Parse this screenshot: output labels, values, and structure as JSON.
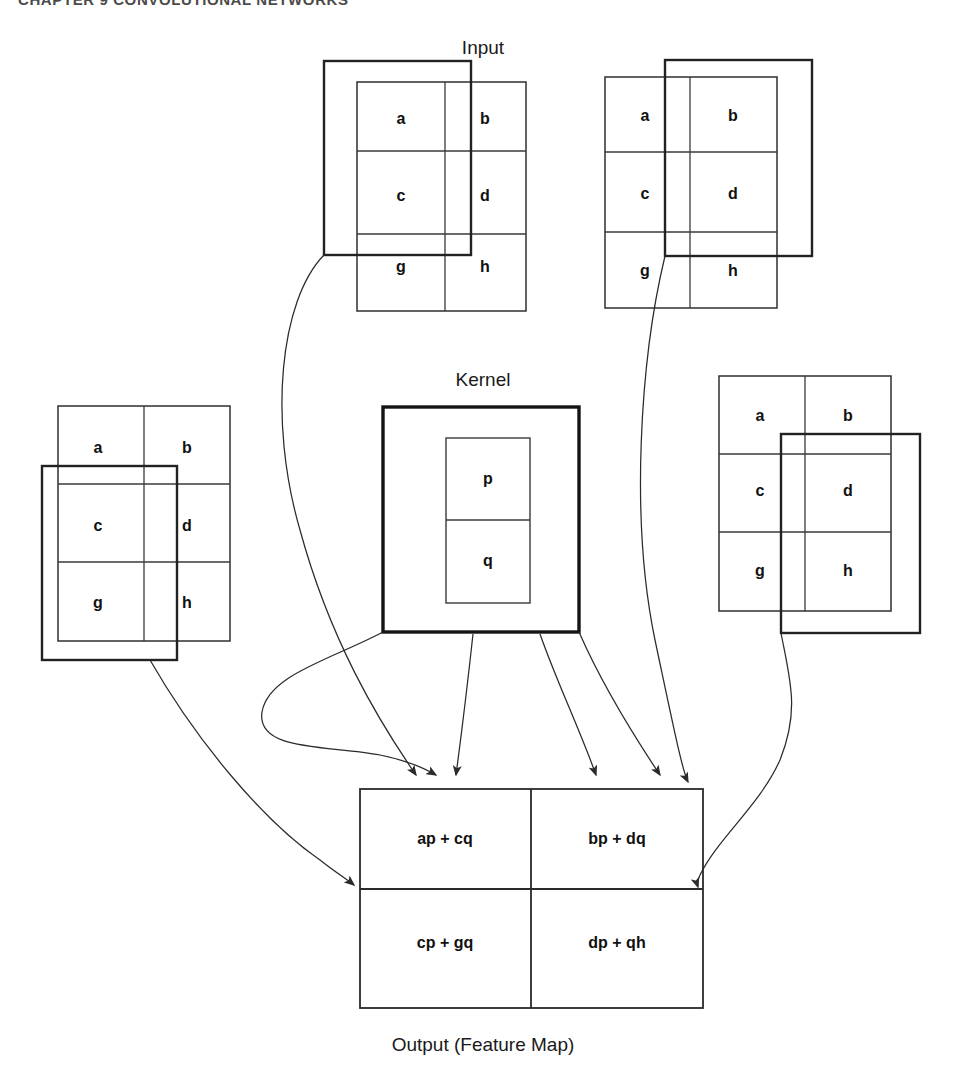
{
  "page": {
    "header_text": "CHAPTER 9    CONVOLUTIONAL NETWORKS",
    "background_color": "#ffffff",
    "line_color": "#2b2b2b"
  },
  "labels": {
    "input": "Input",
    "kernel": "Kernel",
    "output": "Output (Feature Map)"
  },
  "input_grids": [
    {
      "id": "input-grid-top-left",
      "cells": [
        [
          "a",
          "b"
        ],
        [
          "c",
          "d"
        ],
        [
          "g",
          "h"
        ]
      ],
      "highlight_cells": [
        "a",
        "c"
      ],
      "highlight_position": "top-left"
    },
    {
      "id": "input-grid-top-right",
      "cells": [
        [
          "a",
          "b"
        ],
        [
          "c",
          "d"
        ],
        [
          "g",
          "h"
        ]
      ],
      "highlight_cells": [
        "b",
        "d"
      ],
      "highlight_position": "top-right"
    },
    {
      "id": "input-grid-bottom-left",
      "cells": [
        [
          "a",
          "b"
        ],
        [
          "c",
          "d"
        ],
        [
          "g",
          "h"
        ]
      ],
      "highlight_cells": [
        "c",
        "g"
      ],
      "highlight_position": "bottom-left"
    },
    {
      "id": "input-grid-bottom-right",
      "cells": [
        [
          "a",
          "b"
        ],
        [
          "c",
          "d"
        ],
        [
          "g",
          "h"
        ]
      ],
      "highlight_cells": [
        "d",
        "h"
      ],
      "highlight_position": "bottom-right"
    }
  ],
  "kernel": {
    "cells": [
      [
        "p"
      ],
      [
        "q"
      ]
    ],
    "rows": 2,
    "cols": 1
  },
  "output": {
    "rows": 2,
    "cols": 2,
    "cells": [
      [
        "ap + cq",
        "bp + dq"
      ],
      [
        "cp + gq",
        "dp + qh"
      ]
    ]
  },
  "cell_text": {
    "a": "a",
    "b": "b",
    "c": "c",
    "d": "d",
    "g": "g",
    "h": "h",
    "p": "p",
    "q": "q"
  },
  "output_text": {
    "r0c0": "ap + cq",
    "r0c1": "bp + dq",
    "r1c0": "cp + gq",
    "r1c1": "dp + qh"
  },
  "arrow_count": 6
}
